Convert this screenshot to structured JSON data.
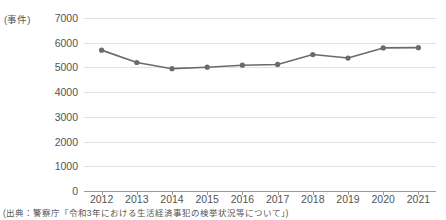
{
  "chart_data": {
    "type": "line",
    "title": "",
    "unit_label": "(事件)",
    "xlabel": "",
    "ylabel": "",
    "categories": [
      "2012",
      "2013",
      "2014",
      "2015",
      "2016",
      "2017",
      "2018",
      "2019",
      "2020",
      "2021"
    ],
    "values": [
      5700,
      5200,
      4950,
      5010,
      5090,
      5120,
      5520,
      5380,
      5790,
      5800
    ],
    "series": [
      {
        "name": "生活経済事犯 検挙件数",
        "values": [
          5700,
          5200,
          4950,
          5010,
          5090,
          5120,
          5520,
          5380,
          5790,
          5800
        ],
        "color": "#6b6b6b",
        "marker": "circle"
      }
    ],
    "ylim": [
      0,
      7000
    ],
    "yticks": [
      "0",
      "1000",
      "2000",
      "3000",
      "4000",
      "5000",
      "6000",
      "7000"
    ],
    "ytick_values": [
      0,
      1000,
      2000,
      3000,
      4000,
      5000,
      6000,
      7000
    ],
    "grid": true,
    "legend": false,
    "legend_position": "none",
    "line_color": "#6b6b6b",
    "gridline_color": "#e2e2e2",
    "axis_color": "#9a9a9a",
    "text_color": "#545454"
  },
  "source": {
    "note": "(出典：警察庁「令和3年における生活経済事犯の検挙状況等について」)"
  }
}
